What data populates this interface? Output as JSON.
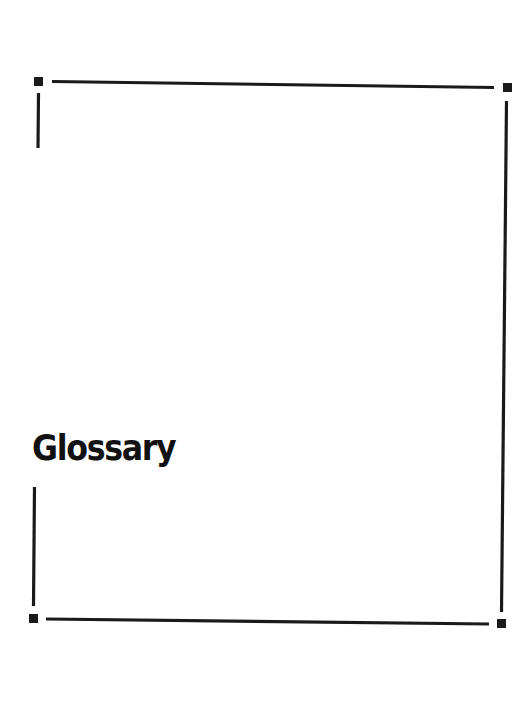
{
  "page": {
    "title": "Glossary"
  },
  "frame": {
    "stroke_color": "#1a1a1a",
    "corner_squares": [
      {
        "name": "top-left",
        "x": 34,
        "y": 77,
        "size": 9
      },
      {
        "name": "top-right",
        "x": 503,
        "y": 83,
        "size": 9
      },
      {
        "name": "bottom-right",
        "x": 497,
        "y": 619,
        "size": 9
      },
      {
        "name": "bottom-left",
        "x": 29,
        "y": 614,
        "size": 9
      }
    ]
  }
}
